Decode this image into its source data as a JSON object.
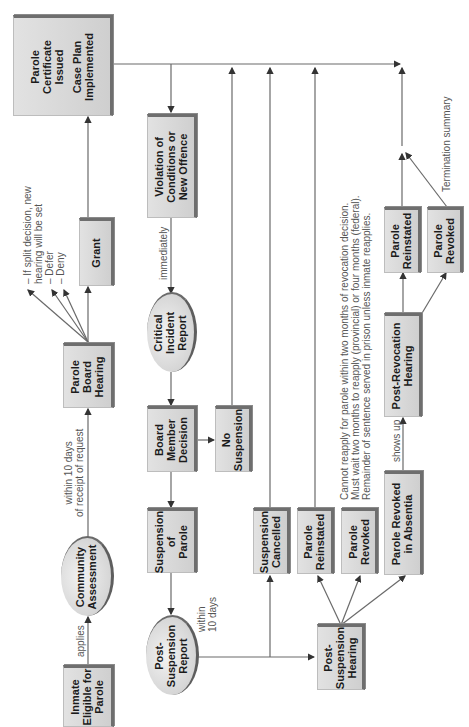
{
  "diagram": {
    "orientation": "rotated -90deg (reads bottom to top)",
    "nodes": {
      "parole_certificate": {
        "line1": "Parole",
        "line2": "Certificate",
        "line3": "Issued",
        "line4": "Case Plan",
        "line5": "Implemented"
      },
      "violation": {
        "line1": "Violation of",
        "line2": "Conditions or",
        "line3": "New Offence"
      },
      "grant": {
        "line1": "Grant"
      },
      "critical_incident": {
        "line1": "Critical",
        "line2": "Incident",
        "line3": "Report"
      },
      "parole_board_hearing": {
        "line1": "Parole",
        "line2": "Board",
        "line3": "Hearing"
      },
      "board_member_decision": {
        "line1": "Board",
        "line2": "Member",
        "line3": "Decision"
      },
      "no_suspension": {
        "line1": "No",
        "line2": "Suspension"
      },
      "community_assessment": {
        "line1": "Community",
        "line2": "Assessment"
      },
      "suspension_of_parole": {
        "line1": "Suspension",
        "line2": "of",
        "line3": "Parole"
      },
      "inmate_eligible": {
        "line1": "Inmate",
        "line2": "Eligible for",
        "line3": "Parole"
      },
      "post_suspension_report": {
        "line1": "Post-",
        "line2": "Suspension",
        "line3": "Report"
      },
      "suspension_cancelled": {
        "line1": "Suspension",
        "line2": "Cancelled"
      },
      "parole_reinstated_1": {
        "line1": "Parole",
        "line2": "Reinstated"
      },
      "parole_revoked_1": {
        "line1": "Parole",
        "line2": "Revoked"
      },
      "parole_revoked_absentia": {
        "line1": "Parole Revoked",
        "line2": "in Absentia"
      },
      "post_suspension_hearing": {
        "line1": "Post-",
        "line2": "Suspension",
        "line3": "Hearing"
      },
      "post_revocation_hearing": {
        "line1": "Post-Revocation",
        "line2": "Hearing"
      },
      "parole_reinstated_2": {
        "line1": "Parole",
        "line2": "Reinstated"
      },
      "parole_revoked_2": {
        "line1": "Parole",
        "line2": "Revoked"
      }
    },
    "labels": {
      "board_outcomes": {
        "line1": "– If split decision, new",
        "line2": "   hearing will be set",
        "line3": "– Defer",
        "line4": "– Deny"
      },
      "within_10_days_request": {
        "line1": "within 10 days",
        "line2": "of receipt of request"
      },
      "applies": "applies",
      "immediately": "immediately",
      "within_10_days": {
        "line1": "within",
        "line2": "10 days"
      },
      "reapply_note": {
        "line1": "Cannot reapply for parole within two months of revocation decision.",
        "line2": "Must wait two months to reapply (provincial) or four months (federal).",
        "line3": "Remainder of sentence served in prison unless inmate reapplies."
      },
      "shows_up": "shows up",
      "termination_summary": "Termination summary"
    },
    "colors": {
      "line": "#6a6a6a",
      "box_border": "#6e6e6e",
      "box_fill": "#d9d9d9",
      "text": "#1b1b1b",
      "label": "#555555"
    }
  }
}
